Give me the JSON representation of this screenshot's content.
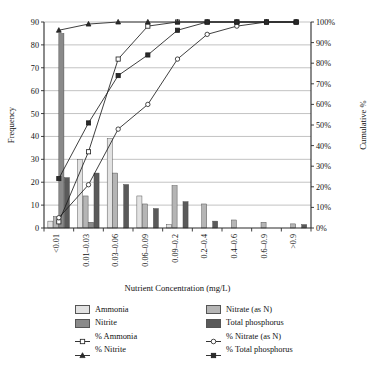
{
  "chart_data": {
    "type": "bar",
    "title": "",
    "xlabel": "Nutrient Concentration (mg/L)",
    "ylabel": "Frequency",
    "y2label": "Cumulative %",
    "ylim": [
      0,
      90
    ],
    "y2lim": [
      0,
      100
    ],
    "grid": true,
    "legend_position": "bottom",
    "categories": [
      "<0.01",
      "0.01–0.03",
      "0.03–0.06",
      "0.06–0.09",
      "0.09–0.2",
      "0.2–0.4",
      "0.4–0.6",
      "0.6–0.9",
      ">0.9"
    ],
    "yticks": [
      0,
      10,
      20,
      30,
      40,
      50,
      60,
      70,
      80,
      90
    ],
    "y2ticks": [
      "0%",
      "10%",
      "20%",
      "30%",
      "40%",
      "50%",
      "60%",
      "70%",
      "80%",
      "90%",
      "100%"
    ],
    "series": [
      {
        "name": "Ammonia",
        "kind": "bar",
        "color": "#e2e2e2",
        "values": [
          3,
          30,
          39,
          14,
          1.5,
          0,
          0,
          0,
          0
        ]
      },
      {
        "name": "Nitrate (as N)",
        "kind": "bar",
        "color": "#b5b5b5",
        "values": [
          5,
          14,
          24,
          10.5,
          18.5,
          10.5,
          3.5,
          2.5,
          1.8
        ]
      },
      {
        "name": "Nitrite",
        "kind": "bar",
        "color": "#8a8a8a",
        "values": [
          85,
          2.5,
          0,
          0,
          0,
          0,
          0,
          0,
          0
        ]
      },
      {
        "name": "Total phosphorus",
        "kind": "bar",
        "color": "#5a5a5a",
        "values": [
          22,
          24,
          19,
          8.5,
          11.5,
          3,
          0,
          0,
          1.5
        ]
      },
      {
        "name": "% Ammonia",
        "kind": "line",
        "marker": "open-square",
        "values": [
          3,
          37,
          82,
          98,
          100,
          100,
          100,
          100,
          100
        ]
      },
      {
        "name": "% Nitrate (as N)",
        "kind": "line",
        "marker": "open-circle",
        "values": [
          5,
          21,
          48,
          60,
          82,
          94,
          98,
          100,
          100
        ]
      },
      {
        "name": "% Nitrite",
        "kind": "line",
        "marker": "filled-triangle",
        "values": [
          96,
          99,
          100,
          100,
          100,
          100,
          100,
          100,
          100
        ]
      },
      {
        "name": "% Total phosphorus",
        "kind": "line",
        "marker": "filled-square",
        "values": [
          24,
          51,
          74,
          84,
          96,
          100,
          100,
          100,
          100
        ]
      }
    ],
    "legend": [
      {
        "label": "Ammonia",
        "type": "swatch",
        "color": "#e2e2e2"
      },
      {
        "label": "Nitrate (as N)",
        "type": "swatch",
        "color": "#b5b5b5"
      },
      {
        "label": "Nitrite",
        "type": "swatch",
        "color": "#8a8a8a"
      },
      {
        "label": "Total phosphorus",
        "type": "swatch",
        "color": "#5a5a5a"
      },
      {
        "label": "% Ammonia",
        "type": "line",
        "marker": "open-square"
      },
      {
        "label": "% Nitrate (as N)",
        "type": "line",
        "marker": "open-circle"
      },
      {
        "label": "% Nitrite",
        "type": "line",
        "marker": "filled-triangle"
      },
      {
        "label": "% Total phosphorus",
        "type": "line",
        "marker": "filled-square"
      }
    ]
  }
}
